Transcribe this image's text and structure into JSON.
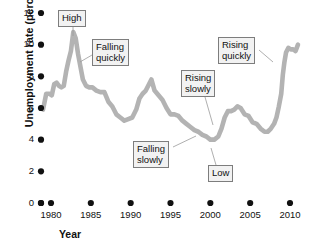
{
  "chart_data": {
    "type": "line",
    "title": "",
    "xlabel": "Year",
    "ylabel": "Unemployment rate (percent)",
    "xlim": [
      1979,
      2011
    ],
    "ylim": [
      0,
      12
    ],
    "grid": false,
    "legend": "none",
    "x_ticks": [
      "1980",
      "1985",
      "1990",
      "1995",
      "2000",
      "2005",
      "2010"
    ],
    "x_tick_values": [
      1980,
      1985,
      1990,
      1995,
      2000,
      2005,
      2010
    ],
    "y_ticks": [
      "0",
      "2",
      "4",
      "6",
      "8",
      "10",
      "12"
    ],
    "y_tick_values": [
      0,
      2,
      4,
      6,
      8,
      10,
      12
    ],
    "series_name": "Unemployment rate",
    "series_color": "#b3b3b3",
    "x": [
      1979.0,
      1979.4,
      1979.8,
      1980.1,
      1980.4,
      1980.7,
      1981.0,
      1981.3,
      1981.6,
      1981.9,
      1982.2,
      1982.5,
      1982.8,
      1983.1,
      1983.4,
      1983.7,
      1984.0,
      1984.4,
      1984.8,
      1985.2,
      1985.7,
      1986.2,
      1986.7,
      1987.2,
      1987.7,
      1988.2,
      1988.7,
      1989.2,
      1989.7,
      1990.2,
      1990.7,
      1991.1,
      1991.5,
      1991.9,
      1992.3,
      1992.6,
      1993.0,
      1993.5,
      1994.0,
      1994.5,
      1995.0,
      1995.5,
      1996.0,
      1996.5,
      1997.0,
      1997.5,
      1998.0,
      1998.5,
      1999.0,
      1999.5,
      2000.0,
      2000.5,
      2001.0,
      2001.4,
      2001.8,
      2002.2,
      2002.6,
      2003.0,
      2003.4,
      2003.8,
      2004.3,
      2004.8,
      2005.3,
      2005.8,
      2006.3,
      2006.8,
      2007.2,
      2007.6,
      2008.0,
      2008.3,
      2008.6,
      2008.9,
      2009.1,
      2009.3,
      2009.5,
      2009.8,
      2010.1,
      2010.4,
      2010.7,
      2011.0
    ],
    "y": [
      5.9,
      6.9,
      6.9,
      6.8,
      7.5,
      7.6,
      7.4,
      7.3,
      7.4,
      8.3,
      9.0,
      9.6,
      10.8,
      10.4,
      9.4,
      8.6,
      7.8,
      7.4,
      7.3,
      7.3,
      7.1,
      7.0,
      7.0,
      6.4,
      6.1,
      5.6,
      5.4,
      5.2,
      5.3,
      5.4,
      5.9,
      6.6,
      6.9,
      7.1,
      7.5,
      7.8,
      7.1,
      6.8,
      6.5,
      6.0,
      5.6,
      5.6,
      5.5,
      5.2,
      5.0,
      4.8,
      4.6,
      4.5,
      4.3,
      4.2,
      4.0,
      4.0,
      4.2,
      4.7,
      5.4,
      5.8,
      5.8,
      5.9,
      6.1,
      6.0,
      5.6,
      5.5,
      5.1,
      5.0,
      4.7,
      4.5,
      4.5,
      4.7,
      5.0,
      5.4,
      6.1,
      6.9,
      8.1,
      8.9,
      9.5,
      9.8,
      9.7,
      9.7,
      9.6,
      10.0
    ],
    "annotations": [
      {
        "id": "high",
        "label_lines": [
          "High"
        ],
        "x": 1982.8,
        "y": 10.8
      },
      {
        "id": "falling-quickly",
        "label_lines": [
          "Falling",
          "quickly"
        ],
        "x": 1983.6,
        "y": 9.3
      },
      {
        "id": "falling-slowly",
        "label_lines": [
          "Falling",
          "slowly"
        ],
        "x": 1997.2,
        "y": 4.9
      },
      {
        "id": "low",
        "label_lines": [
          "Low"
        ],
        "x": 2000.2,
        "y": 4.0
      },
      {
        "id": "rising-slowly",
        "label_lines": [
          "Rising",
          "slowly"
        ],
        "x": 2002.1,
        "y": 5.7
      },
      {
        "id": "rising-quickly",
        "label_lines": [
          "Rising",
          "quickly"
        ],
        "x": 2008.9,
        "y": 6.9
      }
    ]
  },
  "axes": {
    "y_axis_title": "Unemployment rate (percent)",
    "x_axis_title": "Year"
  }
}
